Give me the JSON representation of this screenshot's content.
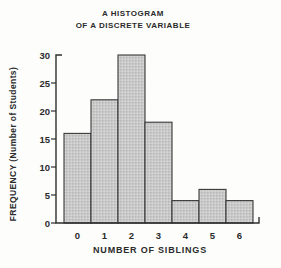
{
  "figure": {
    "title_line1": "A HISTOGRAM",
    "title_line2": "OF A DISCRETE VARIABLE",
    "background": "#fdfdfb"
  },
  "chart_data": {
    "type": "bar",
    "title": "A HISTOGRAM OF A DISCRETE VARIABLE",
    "xlabel": "NUMBER OF SIBLINGS",
    "ylabel": "FREQUENCY (Number of Students)",
    "categories": [
      "0",
      "1",
      "2",
      "3",
      "4",
      "5",
      "6"
    ],
    "values": [
      16,
      22,
      30,
      18,
      4,
      6,
      4
    ],
    "ylim": [
      0,
      30
    ],
    "yticks": [
      0,
      5,
      10,
      15,
      20,
      25,
      30
    ],
    "grid": false,
    "legend": "none",
    "bar_style": "stippled",
    "colors": {
      "bar_fill": "#c9c9c9",
      "bar_fill_dot_dark": "#bababa",
      "bar_fill_dot_light": "#d7d7d7",
      "bar_stroke": "#3a3a3a",
      "axis": "#2e2e2e",
      "text": "#2b2b2b"
    }
  }
}
